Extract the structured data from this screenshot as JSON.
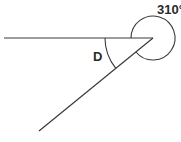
{
  "diagram": {
    "type": "angle-diagram",
    "labels": {
      "reflex_angle": "310°",
      "interior_angle": "D"
    },
    "geometry": {
      "vertex": [
        153,
        38
      ],
      "horizontal_ray_end": [
        4,
        38
      ],
      "slanted_ray_end": [
        39,
        131
      ],
      "reflex_arc_radius": 22,
      "interior_arc_radius": 48
    },
    "colors": {
      "stroke": "#3a3a3a",
      "text": "#2a2a2a",
      "background": "#ffffff"
    }
  }
}
